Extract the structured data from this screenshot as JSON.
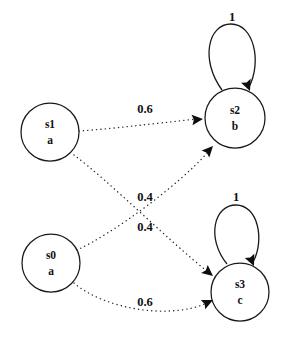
{
  "diagram": {
    "type": "state-diagram",
    "background_color": "#ffffff",
    "stroke_color": "#1a1a1a",
    "nodes": [
      {
        "id": "s1",
        "name": "s1",
        "output": "a",
        "cx": 50,
        "cy": 132,
        "r": 29
      },
      {
        "id": "s2",
        "name": "s2",
        "output": "b",
        "cx": 235,
        "cy": 118,
        "r": 30
      },
      {
        "id": "s0",
        "name": "s0",
        "output": "a",
        "cx": 51,
        "cy": 263,
        "r": 29
      },
      {
        "id": "s3",
        "name": "s3",
        "output": "c",
        "cx": 240,
        "cy": 292,
        "r": 29
      }
    ],
    "edges": [
      {
        "id": "s1-to-s2",
        "from": "s1",
        "to": "s2",
        "weight": "0.6",
        "label_x": 145,
        "label_y": 110,
        "path": "M 79 131 C 110 129, 150 124, 197 119",
        "arrow_x": 203,
        "arrow_y": 119,
        "arrow_angle": -5
      },
      {
        "id": "s1-to-s3",
        "from": "s1",
        "to": "s3",
        "weight": "0.4",
        "label_x": 145,
        "label_y": 198,
        "path": "M 74 155 C 110 182, 168 240, 208 272",
        "arrow_x": 213,
        "arrow_y": 276,
        "arrow_angle": 39
      },
      {
        "id": "s0-to-s2",
        "from": "s0",
        "to": "s2",
        "weight": "0.4",
        "label_x": 145,
        "label_y": 228,
        "path": "M 77 250 C 112 234, 178 186, 208 152",
        "arrow_x": 213,
        "arrow_y": 146,
        "arrow_angle": -47
      },
      {
        "id": "s0-to-s3",
        "from": "s0",
        "to": "s3",
        "weight": "0.6",
        "label_x": 145,
        "label_y": 303,
        "path": "M 74 283 C 104 309, 170 320, 207 303",
        "arrow_x": 213,
        "arrow_y": 300,
        "arrow_angle": -25
      }
    ],
    "self_loops": [
      {
        "id": "s2-self-loop",
        "on": "s2",
        "weight": "1",
        "label_x": 232,
        "label_y": 18,
        "path": "M 222 90 C 200 60, 208 24, 231 24 C 254 24, 262 62, 249 87",
        "arrow_x": 250,
        "arrow_y": 91,
        "arrow_angle": 68
      },
      {
        "id": "s3-self-loop",
        "on": "s3",
        "weight": "1",
        "label_x": 236,
        "label_y": 198,
        "path": "M 227 264 C 206 238, 214 205, 236 205 C 258 205, 265 240, 253 262",
        "arrow_x": 254,
        "arrow_y": 266,
        "arrow_angle": 66
      }
    ]
  }
}
